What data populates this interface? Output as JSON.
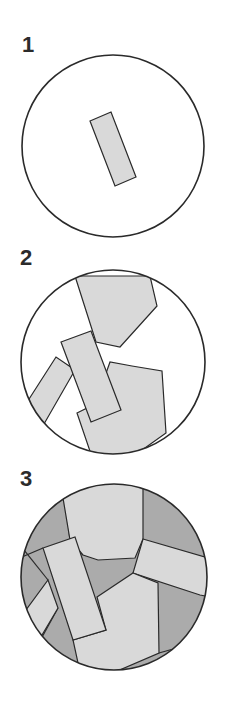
{
  "colors": {
    "outline": "#2a2a2a",
    "light_fill": "#d9d9d9",
    "dark_fill": "#ababab",
    "background": "#ffffff"
  },
  "panels": [
    {
      "label": "1",
      "description": "Single rectangular grain inside a circle"
    },
    {
      "label": "2",
      "description": "Several grains growing, separated by empty space"
    },
    {
      "label": "3",
      "description": "Grains fill the circle with darker interstitial regions"
    }
  ]
}
